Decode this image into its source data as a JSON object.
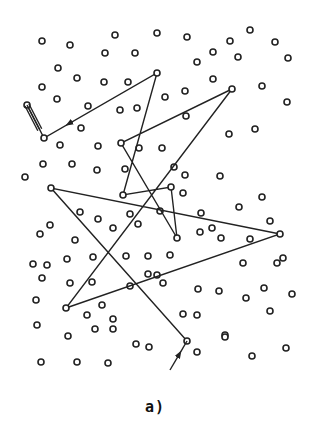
{
  "figure": {
    "caption": "a)",
    "colors": {
      "ink": "#222222",
      "background": "#ffffff"
    },
    "point_radius": 3,
    "points": [
      [
        42,
        41
      ],
      [
        70,
        45
      ],
      [
        115,
        35
      ],
      [
        157,
        33
      ],
      [
        187,
        37
      ],
      [
        230,
        41
      ],
      [
        250,
        30
      ],
      [
        275,
        42
      ],
      [
        105,
        53
      ],
      [
        135,
        53
      ],
      [
        213,
        52
      ],
      [
        288,
        58
      ],
      [
        58,
        68
      ],
      [
        77,
        78
      ],
      [
        104,
        82
      ],
      [
        128,
        82
      ],
      [
        197,
        62
      ],
      [
        238,
        57
      ],
      [
        42,
        87
      ],
      [
        57,
        99
      ],
      [
        88,
        106
      ],
      [
        120,
        110
      ],
      [
        137,
        108
      ],
      [
        185,
        91
      ],
      [
        165,
        97
      ],
      [
        213,
        79
      ],
      [
        262,
        86
      ],
      [
        81,
        128
      ],
      [
        60,
        145
      ],
      [
        98,
        146
      ],
      [
        139,
        148
      ],
      [
        162,
        148
      ],
      [
        186,
        116
      ],
      [
        229,
        134
      ],
      [
        287,
        102
      ],
      [
        25,
        177
      ],
      [
        43,
        164
      ],
      [
        72,
        164
      ],
      [
        97,
        170
      ],
      [
        125,
        169
      ],
      [
        174,
        167
      ],
      [
        185,
        175
      ],
      [
        255,
        129
      ],
      [
        80,
        212
      ],
      [
        98,
        219
      ],
      [
        130,
        214
      ],
      [
        160,
        211
      ],
      [
        183,
        193
      ],
      [
        220,
        176
      ],
      [
        201,
        213
      ],
      [
        239,
        207
      ],
      [
        262,
        197
      ],
      [
        50,
        225
      ],
      [
        40,
        234
      ],
      [
        75,
        240
      ],
      [
        113,
        228
      ],
      [
        138,
        224
      ],
      [
        200,
        232
      ],
      [
        221,
        238
      ],
      [
        270,
        221
      ],
      [
        33,
        264
      ],
      [
        47,
        265
      ],
      [
        67,
        259
      ],
      [
        93,
        257
      ],
      [
        126,
        256
      ],
      [
        148,
        256
      ],
      [
        170,
        255
      ],
      [
        212,
        228
      ],
      [
        250,
        239
      ],
      [
        283,
        258
      ],
      [
        42,
        278
      ],
      [
        70,
        283
      ],
      [
        92,
        282
      ],
      [
        102,
        305
      ],
      [
        130,
        286
      ],
      [
        148,
        274
      ],
      [
        163,
        283
      ],
      [
        198,
        289
      ],
      [
        219,
        291
      ],
      [
        243,
        263
      ],
      [
        277,
        263
      ],
      [
        36,
        300
      ],
      [
        87,
        315
      ],
      [
        113,
        319
      ],
      [
        157,
        275
      ],
      [
        183,
        314
      ],
      [
        246,
        298
      ],
      [
        264,
        288
      ],
      [
        292,
        294
      ],
      [
        37,
        325
      ],
      [
        68,
        336
      ],
      [
        95,
        329
      ],
      [
        113,
        329
      ],
      [
        136,
        344
      ],
      [
        149,
        347
      ],
      [
        197,
        315
      ],
      [
        225,
        335
      ],
      [
        270,
        311
      ],
      [
        41,
        362
      ],
      [
        77,
        362
      ],
      [
        108,
        363
      ],
      [
        197,
        352
      ],
      [
        225,
        337
      ],
      [
        252,
        356
      ],
      [
        286,
        348
      ]
    ],
    "path_vertices": [
      [
        187,
        341
      ],
      [
        51,
        188
      ],
      [
        280,
        234
      ],
      [
        66,
        308
      ],
      [
        232,
        89
      ],
      [
        121,
        143
      ],
      [
        177,
        238
      ],
      [
        171,
        187
      ],
      [
        123,
        195
      ],
      [
        157,
        73
      ],
      [
        44,
        138
      ],
      [
        27,
        105
      ]
    ],
    "start_arrow": {
      "from": [
        170,
        370
      ],
      "to": [
        187,
        341
      ]
    },
    "end_marker": {
      "at": [
        27,
        105
      ],
      "style": "triple-line"
    }
  }
}
